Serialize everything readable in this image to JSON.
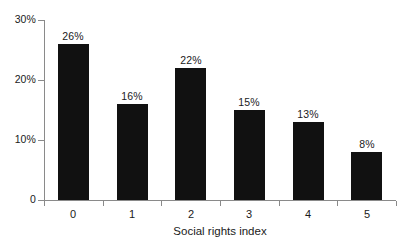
{
  "chart_data": {
    "type": "bar",
    "title": "",
    "xlabel": "Social rights index",
    "ylabel": "",
    "categories": [
      "0",
      "1",
      "2",
      "3",
      "4",
      "5"
    ],
    "values": [
      26,
      16,
      22,
      15,
      13,
      8
    ],
    "data_labels": [
      "26%",
      "16%",
      "22%",
      "15%",
      "13%",
      "8%"
    ],
    "ylim": [
      0,
      30
    ],
    "yticks": [
      0,
      10,
      20,
      30
    ],
    "ytick_labels": [
      "0",
      "10%",
      "20%",
      "30%"
    ],
    "grid": false,
    "legend": false,
    "bar_color": "#111111",
    "axis_color": "#8a8a8a",
    "background": "#ffffff"
  }
}
